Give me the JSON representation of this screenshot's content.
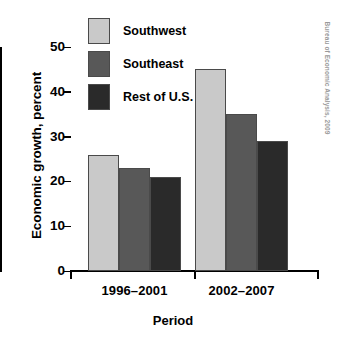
{
  "chart_data": {
    "type": "bar",
    "title": "",
    "xlabel": "Period",
    "ylabel": "Economic growth, percent",
    "categories": [
      "1996–2001",
      "2002–2007"
    ],
    "series": [
      {
        "name": "Southwest",
        "values": [
          26,
          45
        ],
        "color": "#c9c9c9"
      },
      {
        "name": "Southeast",
        "values": [
          23,
          35
        ],
        "color": "#585858"
      },
      {
        "name": "Rest of U.S.",
        "values": [
          21,
          29
        ],
        "color": "#2a2a2a"
      }
    ],
    "ylim": [
      0,
      50
    ],
    "yticks": [
      0,
      10,
      20,
      30,
      40,
      50
    ],
    "ytick_labels": [
      "0",
      "10",
      "20",
      "30",
      "40",
      "50"
    ],
    "grid": false,
    "legend_position": "top-left",
    "annotations": [
      "Bureau of Economic Analysis, 2009"
    ]
  },
  "axes": {
    "y_title": "Economic growth, percent",
    "x_title": "Period"
  },
  "legend": {
    "items": [
      {
        "label": "Southwest"
      },
      {
        "label": "Southeast"
      },
      {
        "label": "Rest of U.S."
      }
    ]
  },
  "source": {
    "credit": "Bureau of Economic Analysis, 2009"
  }
}
